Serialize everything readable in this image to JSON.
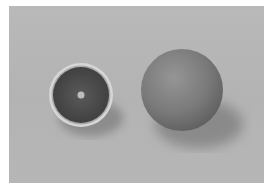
{
  "image": {
    "description": "Black-and-white photograph of an orange cut in half next to a whole orange on a plain light-gray surface",
    "colors": {
      "frame": "#ffffff",
      "background": "#b6b6b6",
      "rind_edge": "#d8d8d8",
      "flesh": "#4a4a4a",
      "core": "#c8c8c8",
      "whole_fruit": "#7c7c7c",
      "shadow": "#8e8e8e"
    },
    "objects": [
      {
        "name": "half-orange",
        "cx": 72,
        "cy": 89,
        "r": 32
      },
      {
        "name": "whole-orange",
        "cx": 173,
        "cy": 84,
        "r": 41
      }
    ]
  }
}
